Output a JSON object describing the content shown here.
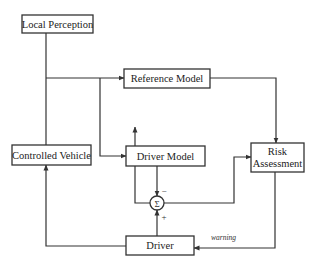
{
  "diagram": {
    "type": "block-diagram",
    "blocks": {
      "local_perception": {
        "label": "Local Perception"
      },
      "reference_model": {
        "label": "Reference Model"
      },
      "controlled_vehicle": {
        "label": "Controlled Vehicle"
      },
      "driver_model": {
        "label": "Driver Model"
      },
      "risk_assessment": {
        "label_line1": "Risk",
        "label_line2": "Assessment"
      },
      "driver": {
        "label": "Driver"
      }
    },
    "summation": {
      "symbol": "Σ",
      "minus_sign": "−",
      "plus_sign": "+"
    },
    "edge_labels": {
      "warning": "warning"
    },
    "colors": {
      "line": "#333333",
      "background": "#ffffff",
      "text": "#222222"
    }
  }
}
